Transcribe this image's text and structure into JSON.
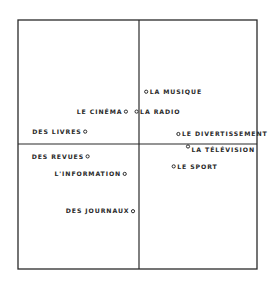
{
  "chart_data": {
    "type": "scatter",
    "title": "",
    "xlabel": "",
    "ylabel": "",
    "xlim": [
      -1,
      1
    ],
    "ylim": [
      -1,
      1
    ],
    "grid": false,
    "axes_cross_at_origin": true,
    "points": [
      {
        "label": "LA MUSIQUE",
        "x": 0.06,
        "y": 0.42,
        "label_side": "right"
      },
      {
        "label": "LE CINÉMA",
        "x": -0.11,
        "y": 0.26,
        "label_side": "left"
      },
      {
        "label": "LA RADIO",
        "x": -0.02,
        "y": 0.26,
        "label_side": "right"
      },
      {
        "label": "DES LIVRES",
        "x": -0.45,
        "y": 0.1,
        "label_side": "left"
      },
      {
        "label": "LE DIVERTISSEMENT",
        "x": 0.33,
        "y": 0.08,
        "label_side": "right"
      },
      {
        "label": "LA TÉLÉVISION",
        "x": 0.41,
        "y": -0.02,
        "label_side": "right"
      },
      {
        "label": "DES REVUES",
        "x": -0.43,
        "y": -0.1,
        "label_side": "left"
      },
      {
        "label": "LE SPORT",
        "x": 0.29,
        "y": -0.18,
        "label_side": "right"
      },
      {
        "label": "L'INFORMATION",
        "x": -0.12,
        "y": -0.24,
        "label_side": "left"
      },
      {
        "label": "DES JOURNAUX",
        "x": -0.05,
        "y": -0.54,
        "label_side": "left"
      }
    ],
    "colors": {
      "ink": "#2a2a2a",
      "background": "#ffffff"
    }
  }
}
